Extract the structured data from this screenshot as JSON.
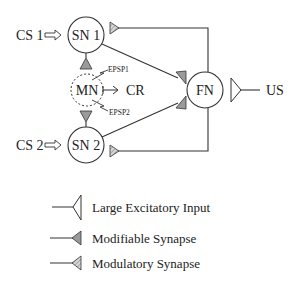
{
  "diagram": {
    "nodes": {
      "sn1": {
        "label": "SN 1"
      },
      "sn2": {
        "label": "SN 2"
      },
      "mn": {
        "label": "MN"
      },
      "fn": {
        "label": "FN"
      }
    },
    "inputs": {
      "cs1": "CS 1",
      "cs2": "CS 2",
      "us": "US"
    },
    "outputs": {
      "cr": "CR"
    },
    "signals": {
      "epsp1": "EPSP1",
      "epsp2": "EPSP2"
    }
  },
  "legend": {
    "items": [
      {
        "label": "Large Excitatory Input",
        "symbol": "open-triangle"
      },
      {
        "label": "Modifiable Synapse",
        "symbol": "filled-gray-triangle"
      },
      {
        "label": "Modulatory Synapse",
        "symbol": "hatched-triangle"
      }
    ]
  },
  "colors": {
    "stroke": "#333333",
    "synapse_fill": "#9a9a9a",
    "modulatory_fill": "#c8c8c8"
  }
}
